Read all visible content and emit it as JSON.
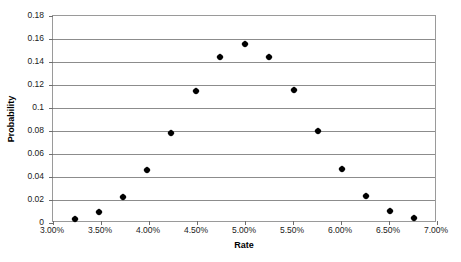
{
  "chart_data": {
    "type": "scatter",
    "title": "",
    "xlabel": "Rate",
    "ylabel": "Probability",
    "xlim": [
      3.0,
      7.0
    ],
    "ylim": [
      0,
      0.18
    ],
    "grid": true,
    "legend_position": "none",
    "marker_style": "filled-diamond",
    "marker_color": "#000000",
    "x_tick_labels": [
      "3.00%",
      "3.50%",
      "4.00%",
      "4.50%",
      "5.00%",
      "5.50%",
      "6.00%",
      "6.50%",
      "7.00%"
    ],
    "x_tick_values": [
      3.0,
      3.5,
      4.0,
      4.5,
      5.0,
      5.5,
      6.0,
      6.5,
      7.0
    ],
    "y_tick_labels": [
      "0",
      "0.02",
      "0.04",
      "0.06",
      "0.08",
      "0.1",
      "0.12",
      "0.14",
      "0.16",
      "0.18"
    ],
    "y_tick_values": [
      0,
      0.02,
      0.04,
      0.06,
      0.08,
      0.1,
      0.12,
      0.14,
      0.16,
      0.18
    ],
    "x": [
      3.23,
      3.48,
      3.73,
      3.98,
      4.23,
      4.49,
      4.74,
      5.0,
      5.25,
      5.51,
      5.76,
      6.01,
      6.26,
      6.51,
      6.76
    ],
    "y": [
      0.0035,
      0.0095,
      0.0225,
      0.046,
      0.078,
      0.115,
      0.1445,
      0.1555,
      0.1445,
      0.1155,
      0.08,
      0.047,
      0.0235,
      0.0105,
      0.004
    ],
    "points": [
      {
        "x": 3.23,
        "y": 0.0035
      },
      {
        "x": 3.48,
        "y": 0.0095
      },
      {
        "x": 3.73,
        "y": 0.0225
      },
      {
        "x": 3.98,
        "y": 0.046
      },
      {
        "x": 4.23,
        "y": 0.078
      },
      {
        "x": 4.49,
        "y": 0.115
      },
      {
        "x": 4.74,
        "y": 0.1445
      },
      {
        "x": 5.0,
        "y": 0.1555
      },
      {
        "x": 5.25,
        "y": 0.1445
      },
      {
        "x": 5.51,
        "y": 0.1155
      },
      {
        "x": 5.76,
        "y": 0.08
      },
      {
        "x": 6.01,
        "y": 0.047
      },
      {
        "x": 6.26,
        "y": 0.0235
      },
      {
        "x": 6.51,
        "y": 0.0105
      },
      {
        "x": 6.76,
        "y": 0.004
      }
    ]
  }
}
